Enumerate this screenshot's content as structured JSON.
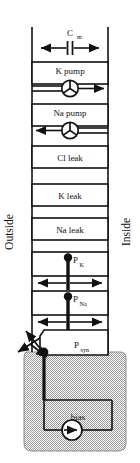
{
  "diagram": {
    "type": "circuit-schematic",
    "canvas": {
      "width": 140,
      "height": 463
    },
    "colors": {
      "line": "#111111",
      "fill": "#ffffff",
      "shade": "#b8b8b8",
      "background": "#ffffff"
    },
    "side_labels": {
      "left": "Outside",
      "right": "Inside"
    },
    "branches": [
      {
        "id": "cm",
        "label": "C",
        "subscript": "m",
        "label_full": "C_m",
        "symbol": "capacitor",
        "arrows": "bidirectional-horizontal"
      },
      {
        "id": "k-pump",
        "label": "K pump",
        "subscript": "",
        "label_full": "K pump",
        "symbol": "pump-rotor",
        "arrows": "right"
      },
      {
        "id": "na-pump",
        "label": "Na pump",
        "subscript": "",
        "label_full": "Na pump",
        "symbol": "pump-rotor",
        "arrows": "left"
      },
      {
        "id": "cl-leak",
        "label": "Cl leak",
        "subscript": "",
        "label_full": "Cl leak",
        "symbol": "box",
        "arrows": "none"
      },
      {
        "id": "k-leak",
        "label": "K leak",
        "subscript": "",
        "label_full": "K leak",
        "symbol": "box",
        "arrows": "none"
      },
      {
        "id": "na-leak",
        "label": "Na leak",
        "subscript": "",
        "label_full": "Na leak",
        "symbol": "box",
        "arrows": "none"
      },
      {
        "id": "p-k",
        "label": "P",
        "subscript": "K",
        "label_full": "P_K",
        "symbol": "gated-conductance",
        "arrows": "bidirectional-horizontal"
      },
      {
        "id": "p-na",
        "label": "P",
        "subscript": "Na",
        "label_full": "P_Na",
        "symbol": "gated-conductance",
        "arrows": "bidirectional-horizontal"
      },
      {
        "id": "p-syn",
        "label": "P",
        "subscript": "syn",
        "label_full": "P_syn",
        "symbol": "variable-conductance",
        "arrows": "diagonal-cross"
      },
      {
        "id": "bias",
        "label": "bias",
        "subscript": "",
        "label_full": "bias",
        "symbol": "current-source",
        "arrows": "right"
      }
    ]
  }
}
